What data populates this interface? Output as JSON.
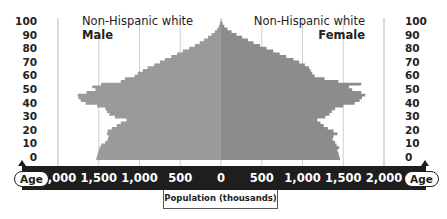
{
  "chart_data": {
    "type": "bar",
    "subtype": "population-pyramid",
    "title_left": "Non-Hispanic white",
    "subtitle_left": "Male",
    "title_right": "Non-Hispanic white",
    "subtitle_right": "Female",
    "xlabel": "Population (thousands)",
    "ylabel": "Age",
    "x_tick_labels": [
      "2,000",
      "1,500",
      "1,000",
      "500",
      "0",
      "500",
      "1,000",
      "1,500",
      "2,000"
    ],
    "x_tick_values": [
      -2000,
      -1500,
      -1000,
      -500,
      0,
      500,
      1000,
      1500,
      2000
    ],
    "y_tick_labels": [
      "100",
      "90",
      "80",
      "70",
      "60",
      "50",
      "40",
      "30",
      "20",
      "10",
      "0"
    ],
    "xlim": [
      -2000,
      2000
    ],
    "ylim": [
      0,
      100
    ],
    "grid": true,
    "colors": {
      "male": "#9a9a9a",
      "female": "#8c8c8c",
      "axis_band": "#1e1e1e",
      "grid": "#d0d0d0"
    },
    "ages": [
      0,
      2,
      4,
      6,
      8,
      10,
      12,
      14,
      16,
      18,
      20,
      22,
      24,
      26,
      28,
      30,
      32,
      34,
      36,
      38,
      40,
      42,
      44,
      46,
      48,
      50,
      52,
      54,
      56,
      58,
      60,
      62,
      64,
      66,
      68,
      70,
      72,
      74,
      76,
      78,
      80,
      82,
      84,
      86,
      88,
      90,
      92,
      94,
      96,
      98,
      100
    ],
    "series": [
      {
        "name": "Male",
        "values": [
          1530,
          1520,
          1510,
          1500,
          1490,
          1470,
          1420,
          1390,
          1380,
          1400,
          1390,
          1340,
          1280,
          1230,
          1160,
          1300,
          1370,
          1400,
          1420,
          1520,
          1660,
          1720,
          1750,
          1760,
          1650,
          1540,
          1580,
          1470,
          1230,
          1180,
          1060,
          1020,
          960,
          900,
          820,
          750,
          690,
          610,
          540,
          470,
          390,
          320,
          260,
          210,
          160,
          115,
          75,
          45,
          25,
          12,
          5
        ]
      },
      {
        "name": "Female",
        "values": [
          1460,
          1450,
          1440,
          1430,
          1450,
          1420,
          1400,
          1370,
          1380,
          1430,
          1380,
          1310,
          1260,
          1220,
          1180,
          1280,
          1330,
          1360,
          1400,
          1500,
          1640,
          1700,
          1730,
          1770,
          1720,
          1610,
          1570,
          1720,
          1440,
          1270,
          1150,
          1120,
          1100,
          1080,
          1030,
          960,
          890,
          800,
          720,
          640,
          560,
          480,
          400,
          330,
          260,
          190,
          130,
          80,
          40,
          18,
          6
        ]
      }
    ]
  },
  "labels": {
    "age_left": "Age",
    "age_right": "Age"
  }
}
